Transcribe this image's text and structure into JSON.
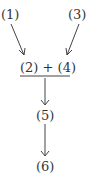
{
  "diagram": {
    "nodes": {
      "n1": "(1)",
      "n3": "(3)",
      "combined": "(2) + (4)",
      "n5": "(5)",
      "n6": "(6)"
    },
    "edges": [
      {
        "from": "(1)",
        "to": "(2) + (4)"
      },
      {
        "from": "(3)",
        "to": "(2) + (4)"
      },
      {
        "from": "(2) + (4)",
        "to": "(5)"
      },
      {
        "from": "(5)",
        "to": "(6)"
      }
    ],
    "colors": {
      "ink": "#333333",
      "background": "#ffffff"
    }
  }
}
